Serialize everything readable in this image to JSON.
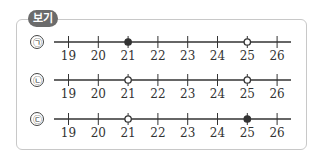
{
  "box": {
    "label": "보기"
  },
  "number_line": {
    "ticks": [
      19,
      20,
      21,
      22,
      23,
      24,
      25,
      26
    ]
  },
  "rows": [
    {
      "label": "㉠",
      "points": [
        {
          "value": 21,
          "type": "filled"
        },
        {
          "value": 25,
          "type": "open"
        }
      ]
    },
    {
      "label": "㉡",
      "points": [
        {
          "value": 21,
          "type": "open"
        },
        {
          "value": 25,
          "type": "open"
        }
      ]
    },
    {
      "label": "㉢",
      "points": [
        {
          "value": 21,
          "type": "open"
        },
        {
          "value": 25,
          "type": "filled"
        }
      ]
    }
  ],
  "colors": {
    "line": "#333333",
    "frame": "#c8c8c8",
    "tag_bg": "#6b6b6b"
  }
}
